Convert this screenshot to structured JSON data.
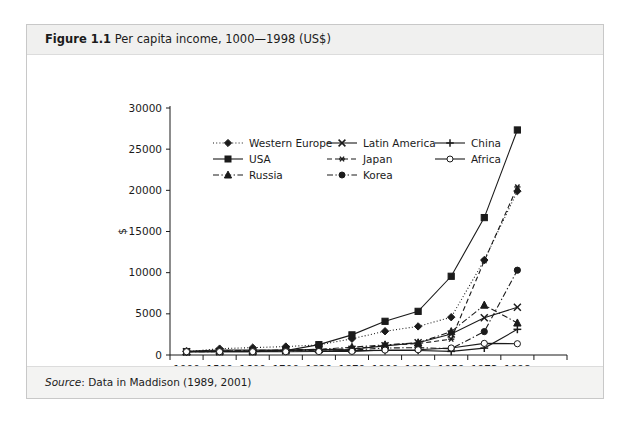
{
  "figure": {
    "number": "Figure 1.1",
    "title": "Per capita income, 1000—1998 (US$)",
    "source_label": "Source",
    "source_text": ": Data in Maddison (1989, 2001)"
  },
  "chart_data": {
    "type": "line",
    "title": "Per capita income, 1000—1998 (US$)",
    "xlabel": "Year",
    "ylabel": "$",
    "categories": [
      "1000",
      "1500",
      "1600",
      "1700",
      "1820",
      "1870",
      "1900",
      "1913",
      "1950",
      "1973",
      "1998"
    ],
    "ylim": [
      0,
      30000
    ],
    "yticks": [
      0,
      5000,
      10000,
      15000,
      20000,
      25000,
      30000
    ],
    "ytick_labels": [
      "0",
      "5000",
      "10000",
      "15000",
      "20000",
      "25000",
      "30000"
    ],
    "grid": false,
    "legend_position": "top-center-inside",
    "series": [
      {
        "name": "Western Europe",
        "marker": "diamond",
        "dash": "dotted",
        "values": [
          400,
          774,
          894,
          1024,
          1232,
          1974,
          2885,
          3473,
          4594,
          11534,
          19900
        ]
      },
      {
        "name": "USA",
        "marker": "square",
        "dash": "solid",
        "values": [
          400,
          400,
          400,
          527,
          1257,
          2445,
          4091,
          5301,
          9561,
          16689,
          27331
        ]
      },
      {
        "name": "Russia",
        "marker": "triangle",
        "dash": "dashdot",
        "values": [
          400,
          499,
          552,
          610,
          689,
          943,
          1237,
          1488,
          2841,
          6059,
          3893
        ]
      },
      {
        "name": "Latin America",
        "marker": "cross",
        "dash": "solid",
        "values": [
          400,
          416,
          438,
          527,
          665,
          698,
          1113,
          1481,
          2554,
          4531,
          5795
        ]
      },
      {
        "name": "Japan",
        "marker": "asterisk",
        "dash": "dashed",
        "values": [
          425,
          500,
          520,
          570,
          669,
          737,
          1180,
          1387,
          1926,
          11439,
          20413
        ]
      },
      {
        "name": "Korea",
        "marker": "circle-filled",
        "dash": "dashdot",
        "values": [
          400,
          420,
          430,
          470,
          600,
          604,
          850,
          893,
          770,
          2841,
          10300
        ]
      },
      {
        "name": "China",
        "marker": "plus",
        "dash": "solid",
        "values": [
          450,
          600,
          600,
          600,
          600,
          530,
          545,
          552,
          439,
          839,
          3117
        ]
      },
      {
        "name": "Africa",
        "marker": "circle-open",
        "dash": "solid",
        "values": [
          400,
          400,
          400,
          400,
          418,
          444,
          600,
          637,
          852,
          1410,
          1368
        ]
      }
    ],
    "legend_rows": [
      [
        "Western Europe",
        "Latin America",
        "China"
      ],
      [
        "USA",
        "Japan",
        "Africa"
      ],
      [
        "Russia",
        "Korea",
        ""
      ]
    ]
  }
}
